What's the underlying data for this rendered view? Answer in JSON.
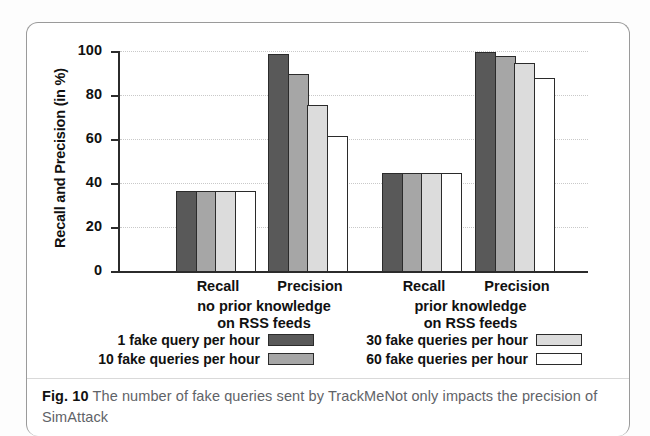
{
  "figure": {
    "caption_label": "Fig. 10",
    "caption_text": "The number of fake queries sent by TrackMeNot only impacts the precision of SimAttack"
  },
  "chart_data": {
    "type": "bar",
    "title": "",
    "xlabel": "",
    "ylabel": "Recall and Precision (in %)",
    "ylim": [
      0,
      100
    ],
    "ytick_labels": [
      "0",
      "20",
      "40",
      "60",
      "80",
      "100"
    ],
    "ytick_values": [
      0,
      20,
      40,
      60,
      80,
      100
    ],
    "grid": true,
    "legend_position": "below-axes",
    "categories": [
      "Recall",
      "Precision",
      "Recall",
      "Precision"
    ],
    "group_captions": [
      "no prior knowledge\non RSS feeds",
      "prior knowledge\non RSS feeds"
    ],
    "group_caption_lines": [
      [
        "no prior knowledge",
        "on RSS feeds"
      ],
      [
        "prior knowledge",
        "on RSS feeds"
      ]
    ],
    "series": [
      {
        "name": "1 fake query per hour",
        "color": "#595959",
        "values": [
          37,
          99,
          45,
          100
        ]
      },
      {
        "name": "10 fake queries per hour",
        "color": "#a6a6a6",
        "values": [
          37,
          90,
          45,
          98
        ]
      },
      {
        "name": "30 fake queries per hour",
        "color": "#dcdcdc",
        "values": [
          37,
          76,
          45,
          95
        ]
      },
      {
        "name": "60 fake queries per hour",
        "color": "#ffffff",
        "values": [
          37,
          62,
          45,
          88
        ]
      }
    ]
  }
}
